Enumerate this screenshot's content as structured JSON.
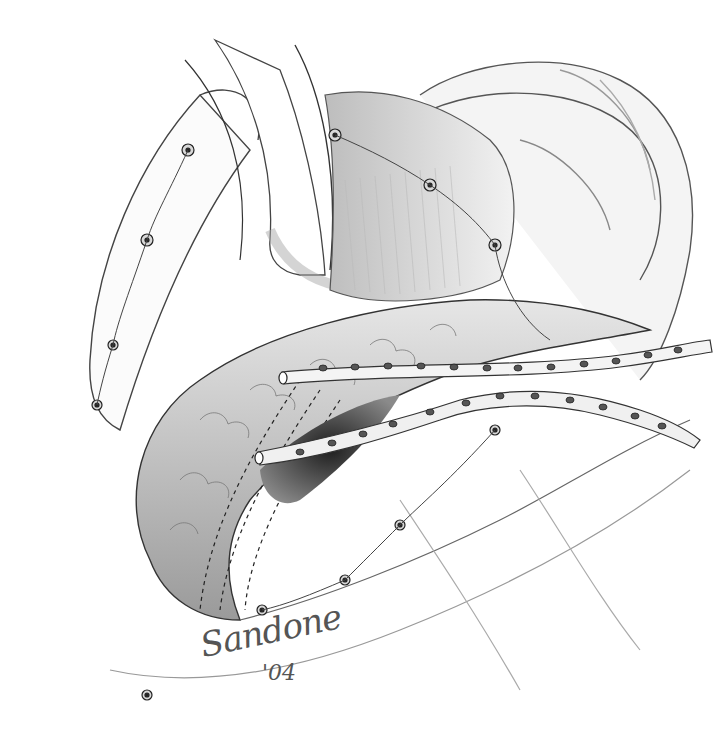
{
  "illustration": {
    "subject": "surgical anatomy pencil illustration with two perforated drain tubes",
    "palette": {
      "paper": "#ffffff",
      "graphite_dark": "#2a2a2a",
      "graphite_mid": "#7a7a7a",
      "graphite_light": "#c8c8c8"
    },
    "drains": [
      {
        "name": "upper-drain",
        "holes": 12
      },
      {
        "name": "lower-drain",
        "holes": 14
      }
    ]
  },
  "signature": {
    "name": "Sandone",
    "year": "'04"
  }
}
